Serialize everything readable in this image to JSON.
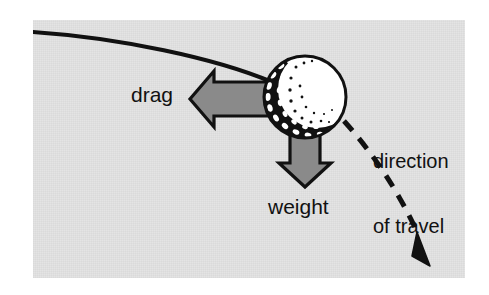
{
  "figure": {
    "type": "physics-force-diagram",
    "width": 489,
    "height": 295,
    "background_color": "#ffffff",
    "panel_color": "#e3e3e3",
    "ink_color": "#111111",
    "arrow_fill_color": "#8a8a8a",
    "arrow_outline_color": "#111111",
    "ball_body_color": "#ffffff",
    "ball_shadow_color": "#111111"
  },
  "labels": {
    "drag": "drag",
    "weight": "weight",
    "direction_of_travel": "direction\nof travel",
    "direction_of_travel_line1": "direction",
    "direction_of_travel_line2": "of travel"
  },
  "elements": {
    "ball": {
      "name": "golf-ball",
      "center_x": 305,
      "center_y": 97,
      "radius": 41,
      "description": "dimpled golf ball, white with dark shaded crescent on lower-left"
    },
    "drag_arrow": {
      "name": "drag-force-arrow",
      "direction": "left",
      "from_x": 285,
      "from_y": 99,
      "to_x": 190,
      "to_y": 99
    },
    "weight_arrow": {
      "name": "weight-force-arrow",
      "direction": "down",
      "from_x": 305,
      "from_y": 130,
      "to_x": 305,
      "to_y": 186
    },
    "incoming_path": {
      "name": "incoming-trajectory",
      "style": "solid",
      "description": "solid curve entering from the left edge descending to the ball"
    },
    "outgoing_path": {
      "name": "direction-of-travel-trajectory",
      "style": "dashed",
      "arrowhead": "solid-triangle",
      "description": "dashed curve leaving the ball to the lower right, ending in an arrowhead"
    }
  }
}
